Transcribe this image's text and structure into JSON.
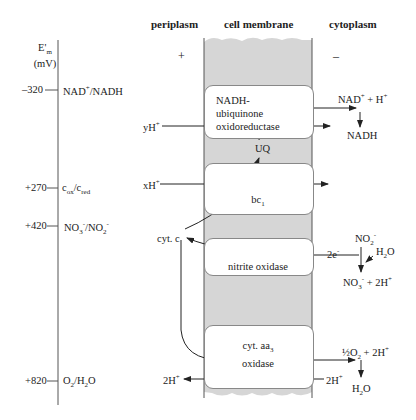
{
  "headers": {
    "periplasm": "periplasm",
    "membrane": "cell membrane",
    "cytoplasm": "cytoplasm"
  },
  "charge": {
    "periplasm": "+",
    "cytoplasm": "–"
  },
  "axis": {
    "label_line1": "E'm",
    "label_line2": "(mV)",
    "ticks": [
      {
        "value": "–320",
        "couple": "NAD+/NADH"
      },
      {
        "value": "+270",
        "couple": "cox/cred"
      },
      {
        "value": "+420",
        "couple": "NO3-/NO2-"
      },
      {
        "value": "+820",
        "couple": "O2/H2O"
      }
    ]
  },
  "complexes": [
    {
      "name": "NADH-ubiquinone oxidoreductase",
      "lines": [
        "NADH-",
        "ubiquinone",
        "oxidoreductase"
      ]
    },
    {
      "name": "bc1",
      "lines": [
        "bc1"
      ]
    },
    {
      "name": "nitrite oxidase",
      "lines": [
        "nitrite oxidase"
      ]
    },
    {
      "name": "cyt. aa3 oxidase",
      "lines": [
        "cyt. aa3",
        "oxidase"
      ]
    }
  ],
  "species": {
    "yH": "yH+",
    "xH": "xH+",
    "uq": "UQ",
    "cytc": "cyt. c",
    "nad_h": "NAD+ + H+",
    "nadh": "NADH",
    "no2": "NO2-",
    "h2o_in": "H2O",
    "two_e": "2e-",
    "no3": "NO3- + 2H+",
    "half_o2": "½O2 + 2H+",
    "h2o_out": "H2O",
    "twoH_in": "2H+",
    "twoH_out": "2H+"
  },
  "colors": {
    "membrane": "#d6d6d6",
    "line": "#222222",
    "box_border": "#888888"
  }
}
